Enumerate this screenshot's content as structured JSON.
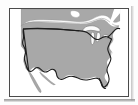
{
  "image": {
    "kind": "framed-map-thumbnail",
    "width_px": 138,
    "height_px": 105,
    "alt_text": "Outline map of the contiguous United States",
    "background_color": "#ffffff",
    "outer_margin_color": "#fdfdfd"
  },
  "frame": {
    "border_color": "#4a4a4a",
    "border_width_px": 1.5,
    "fill_color": "#ffffff",
    "x_px": 9,
    "y_px": 8,
    "width_px": 120,
    "height_px": 89,
    "shadow_color": "#8c8c8c"
  },
  "map": {
    "title": "United States",
    "projection_note": "contiguous 48 states",
    "land_fill_color": "#a8a8a8",
    "land_stroke_color": "#6e6e6e",
    "water_fill_color": "#ffffff",
    "country_border_color": "#1c1c1c",
    "country_border_width_px": 1.1,
    "lake_fill_color": "#fafafa",
    "regions": [
      {
        "name": "canada",
        "label": "Canada",
        "visible": true
      },
      {
        "name": "united-states",
        "label": "United States",
        "visible": true
      },
      {
        "name": "mexico",
        "label": "Mexico",
        "visible": true
      },
      {
        "name": "baja-california",
        "label": "Baja California",
        "visible": true
      }
    ],
    "features": [
      {
        "name": "great-lakes",
        "label": "Great Lakes",
        "visible": true
      },
      {
        "name": "florida-peninsula",
        "label": "Florida",
        "visible": true
      },
      {
        "name": "gulf-of-mexico",
        "label": "Gulf of Mexico",
        "visible": true
      },
      {
        "name": "pacific-ocean",
        "label": "Pacific Ocean",
        "visible": true
      },
      {
        "name": "atlantic-ocean",
        "label": "Atlantic Ocean",
        "visible": true
      },
      {
        "name": "gulf-of-california",
        "label": "Gulf of California",
        "visible": true
      },
      {
        "name": "49th-parallel-border",
        "label": "US-Canada border",
        "visible": true
      }
    ]
  }
}
